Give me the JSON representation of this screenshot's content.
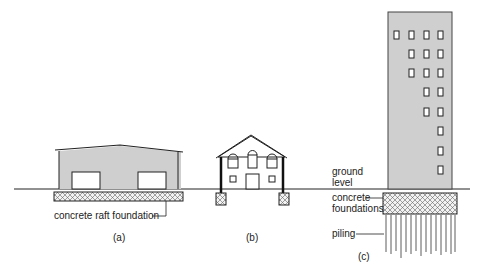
{
  "diagram": {
    "colors": {
      "building_fill": "#cfcfcf",
      "line": "#222222",
      "window_fill": "#ffffff",
      "hatch": "#555555"
    },
    "labels": {
      "raft": "concrete raft foundation",
      "caption_a": "(a)",
      "caption_b": "(b)",
      "caption_c": "(c)",
      "ground_1": "ground",
      "ground_2": "level",
      "concrete_1": "concrete",
      "concrete_2": "foundations",
      "piling": "piling"
    }
  }
}
